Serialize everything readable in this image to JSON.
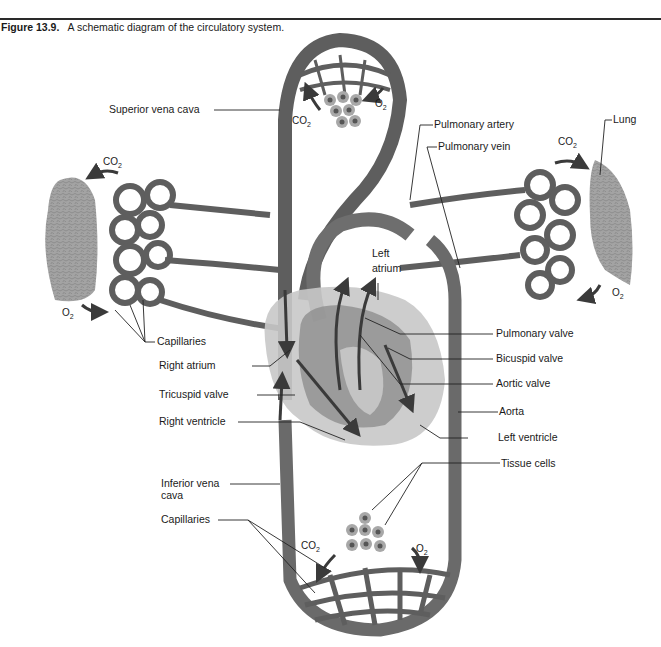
{
  "caption": {
    "figure_number": "Figure 13.9.",
    "text": "A schematic diagram of the circulatory system."
  },
  "labels": {
    "superior_vena_cava": "Superior vena cava",
    "pulmonary_artery": "Pulmonary artery",
    "pulmonary_vein": "Pulmonary vein",
    "lung": "Lung",
    "left_atrium_line1": "Left",
    "left_atrium_line2": "atrium",
    "capillaries_lung": "Capillaries",
    "right_atrium": "Right atrium",
    "tricuspid_valve": "Tricuspid valve",
    "right_ventricle": "Right ventricle",
    "pulmonary_valve": "Pulmonary valve",
    "bicuspid_valve": "Bicuspid valve",
    "aortic_valve": "Aortic valve",
    "aorta": "Aorta",
    "left_ventricle": "Left ventricle",
    "tissue_cells": "Tissue cells",
    "inferior_vena_cava_line1": "Inferior vena",
    "inferior_vena_cava_line2": "cava",
    "capillaries_body": "Capillaries"
  },
  "gases": {
    "co2": "CO",
    "co2_sub": "2",
    "o2": "O",
    "o2_sub": "2"
  },
  "colors": {
    "vessel": "#5e5e5e",
    "vessel_light": "#8a8a8a",
    "heart_outer": "#c8c8c8",
    "heart_inner": "#8f8f8f",
    "lung": "#9c9c9c",
    "cell": "#a8a8a8",
    "nucleus": "#555555"
  }
}
